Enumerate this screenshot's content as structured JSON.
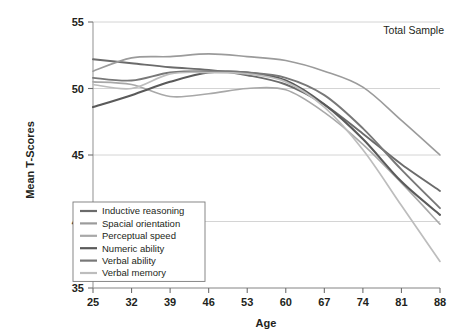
{
  "chart_data": {
    "type": "line",
    "title": "",
    "annotation": "Total Sample",
    "xlabel": "Age",
    "ylabel": "Mean T-Scores",
    "x": [
      25,
      32,
      39,
      46,
      53,
      60,
      67,
      74,
      81,
      88
    ],
    "categories": [
      "25",
      "32",
      "39",
      "46",
      "53",
      "60",
      "67",
      "74",
      "81",
      "88"
    ],
    "xlim": [
      25,
      88
    ],
    "ylim": [
      35,
      55
    ],
    "yticks": [
      35,
      40,
      45,
      50,
      55
    ],
    "xticks": [
      25,
      32,
      39,
      46,
      53,
      60,
      67,
      74,
      81,
      88
    ],
    "grid": "horizontal",
    "legend_position": "bottom-left",
    "series": [
      {
        "name": "Inductive reasoning",
        "color": "#6b6b6b",
        "width": 1.9,
        "values": [
          52.2,
          51.9,
          51.6,
          51.4,
          51.0,
          50.3,
          48.8,
          46.6,
          44.3,
          42.3
        ]
      },
      {
        "name": "Spacial orientation",
        "color": "#9b9b9b",
        "width": 1.6,
        "values": [
          51.3,
          52.3,
          52.4,
          52.6,
          52.4,
          52.1,
          51.3,
          50.1,
          47.6,
          45.0
        ]
      },
      {
        "name": "Perceptual speed",
        "color": "#a8a8a8",
        "width": 1.6,
        "values": [
          50.5,
          50.3,
          49.4,
          49.6,
          50.0,
          49.9,
          48.2,
          45.8,
          42.9,
          39.8
        ]
      },
      {
        "name": "Numeric ability",
        "color": "#5a5a5a",
        "width": 2.1,
        "values": [
          48.6,
          49.5,
          50.5,
          51.2,
          51.2,
          50.6,
          48.8,
          46.2,
          43.0,
          40.5
        ]
      },
      {
        "name": "Verbal ability",
        "color": "#787878",
        "width": 1.9,
        "values": [
          50.8,
          50.6,
          51.2,
          51.3,
          51.2,
          50.8,
          49.5,
          47.0,
          43.9,
          41.0
        ]
      },
      {
        "name": "Verbal memory",
        "color": "#bdbdbd",
        "width": 1.7,
        "values": [
          50.3,
          50.0,
          51.1,
          51.2,
          51.1,
          50.5,
          48.6,
          45.4,
          41.2,
          37.0
        ]
      }
    ]
  }
}
